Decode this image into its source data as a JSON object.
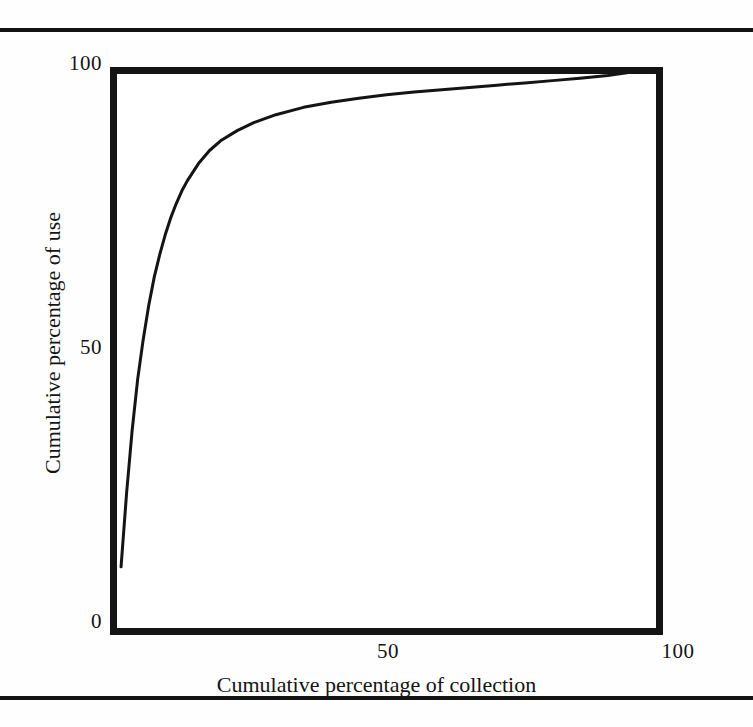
{
  "figure": {
    "top_rule": "horizontal-rule",
    "bottom_rule": "horizontal-rule"
  },
  "axes": {
    "x_title": "Cumulative percentage of collection",
    "y_title": "Cumulative percentage of use",
    "x_ticks": [
      "50",
      "100"
    ],
    "y_ticks": [
      "0",
      "50",
      "100"
    ]
  },
  "chart_data": {
    "type": "line",
    "title": "",
    "subtitle": "",
    "xlabel": "Cumulative percentage of collection",
    "ylabel": "Cumulative percentage of use",
    "xlim": [
      0,
      100
    ],
    "ylim": [
      0,
      100
    ],
    "xticks": [
      50,
      100
    ],
    "yticks": [
      0,
      50,
      100
    ],
    "xticklabels": [
      "50",
      "100"
    ],
    "yticklabels": [
      "0",
      "50",
      "100"
    ],
    "grid": false,
    "legend": false,
    "legend_position": "none",
    "annotations": [],
    "series": [
      {
        "name": "Cumulative use",
        "color": "#141414",
        "linewidth": 3,
        "x": [
          2.0,
          3.0,
          4.0,
          5.0,
          6.0,
          7.0,
          8.0,
          9.0,
          10.0,
          11.0,
          12.0,
          13.0,
          14.0,
          16.0,
          18.0,
          20.0,
          23.0,
          26.0,
          30.0,
          35.0,
          40.0,
          45.0,
          50.0,
          55.0,
          60.0,
          65.0,
          70.0,
          75.0,
          80.0,
          85.0,
          90.0,
          95.0,
          100.0
        ],
        "y": [
          12.0,
          25.0,
          36.0,
          45.0,
          52.0,
          58.0,
          63.0,
          67.0,
          70.5,
          73.5,
          76.0,
          78.2,
          80.0,
          83.0,
          85.3,
          87.0,
          88.8,
          90.2,
          91.6,
          92.9,
          93.8,
          94.5,
          95.1,
          95.6,
          96.0,
          96.4,
          96.8,
          97.2,
          97.6,
          98.0,
          98.5,
          99.2,
          100.0
        ]
      }
    ]
  }
}
